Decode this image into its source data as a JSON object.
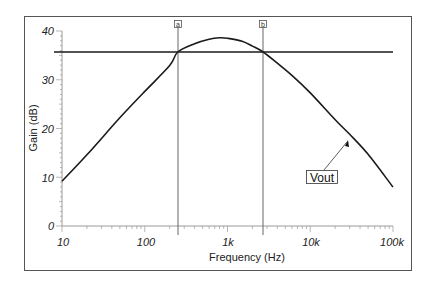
{
  "chart_data": {
    "type": "line",
    "title": "",
    "xlabel": "Frequency (Hz)",
    "ylabel": "Gain (dB)",
    "xscale": "log",
    "xlim": [
      10,
      100000
    ],
    "ylim": [
      0,
      40
    ],
    "x_tick_labels": [
      "10",
      "100",
      "1k",
      "10k",
      "100k"
    ],
    "x_ticks": [
      10,
      100,
      1000,
      10000,
      100000
    ],
    "y_tick_labels": [
      "0",
      "10",
      "20",
      "30",
      "40"
    ],
    "y_ticks": [
      0,
      10,
      20,
      30,
      40
    ],
    "grid": false,
    "series": [
      {
        "name": "Vout",
        "x": [
          10,
          20,
          50,
          100,
          200,
          251,
          400,
          600,
          800,
          1000,
          1500,
          2000,
          2690,
          4000,
          6000,
          10000,
          20000,
          30000,
          50000,
          100000
        ],
        "values": [
          9.2,
          14.6,
          22.2,
          27.6,
          32.9,
          35.7,
          37.4,
          38.3,
          38.6,
          38.5,
          37.9,
          36.9,
          35.7,
          33.4,
          30.9,
          27.3,
          21.8,
          18.8,
          14.7,
          8.0
        ]
      }
    ],
    "reference_line": {
      "type": "horizontal",
      "y": 35.7,
      "label": "-3 dB level"
    },
    "cursors": [
      {
        "label": "a",
        "x": 251
      },
      {
        "label": "b",
        "x": 2690
      }
    ],
    "annotations": [
      {
        "text": "Vout",
        "points_to_x": 25000,
        "points_to_y": 20
      }
    ],
    "legend_position": "inline-callout"
  },
  "labels": {
    "xlabel": "Frequency (Hz)",
    "ylabel": "Gain (dB)",
    "x_ticks": [
      "10",
      "100",
      "1k",
      "10k",
      "100k"
    ],
    "y_ticks": [
      "0",
      "10",
      "20",
      "30",
      "40"
    ],
    "cursor_a": "a",
    "cursor_b": "b",
    "series_callout": "Vout"
  },
  "colors": {
    "line": "#1a1a1a",
    "frame": "#555555",
    "axis": "#9a9a9a",
    "cursor": "#666666"
  }
}
